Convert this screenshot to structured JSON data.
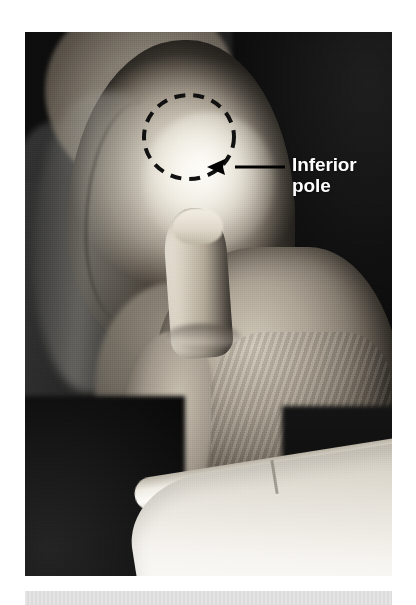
{
  "figure": {
    "kind": "clinical-photograph",
    "modality": "grayscale photo",
    "photo": {
      "x": 25,
      "y": 32,
      "width": 367,
      "height": 544,
      "background_color": "#0d0d0d"
    },
    "page_background_color": "#ffffff"
  },
  "annotations": {
    "label": {
      "text": "Inferior\npole",
      "line1": "Inferior",
      "line2": "pole",
      "color": "#ffffff",
      "x": 292,
      "y": 154
    },
    "arrow": {
      "color": "#000000",
      "direction": "left",
      "tail_x": 285,
      "tip_x": 207,
      "y": 167
    },
    "marker_ellipse": {
      "style": "dashed",
      "color": "#111111",
      "center_x": 189,
      "center_y": 137,
      "radius_x": 45,
      "radius_y": 42,
      "stroke_width": 4,
      "dash": "11 8"
    }
  },
  "caption_band": {
    "color": "#dedede",
    "x": 25,
    "y": 591,
    "width": 367,
    "height": 14
  }
}
